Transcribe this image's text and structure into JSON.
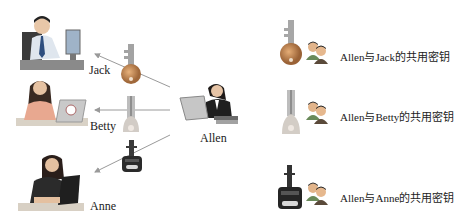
{
  "people": {
    "jack": {
      "name": "Jack"
    },
    "betty": {
      "name": "Betty"
    },
    "anne": {
      "name": "Anne"
    },
    "allen": {
      "name": "Allen"
    }
  },
  "keys": [
    {
      "id": "key-jack",
      "style": "round-bronze",
      "color": "#b07a4a"
    },
    {
      "id": "key-betty",
      "style": "bell-silver",
      "color": "#c8c2bc"
    },
    {
      "id": "key-anne",
      "style": "black-car-key",
      "color": "#2a2a2a"
    }
  ],
  "legend": [
    {
      "label": "Allen与Jack的共用密钥",
      "key_style": "round-bronze"
    },
    {
      "label": "Allen与Betty的共用密钥",
      "key_style": "bell-silver"
    },
    {
      "label": "Allen与Anne的共用密钥",
      "key_style": "black-car-key"
    }
  ],
  "colors": {
    "arrow": "#9a9a9a",
    "bronze_key": "#b07a4a",
    "silver_key": "#c8c2bc",
    "black_key": "#2a2a2a"
  }
}
